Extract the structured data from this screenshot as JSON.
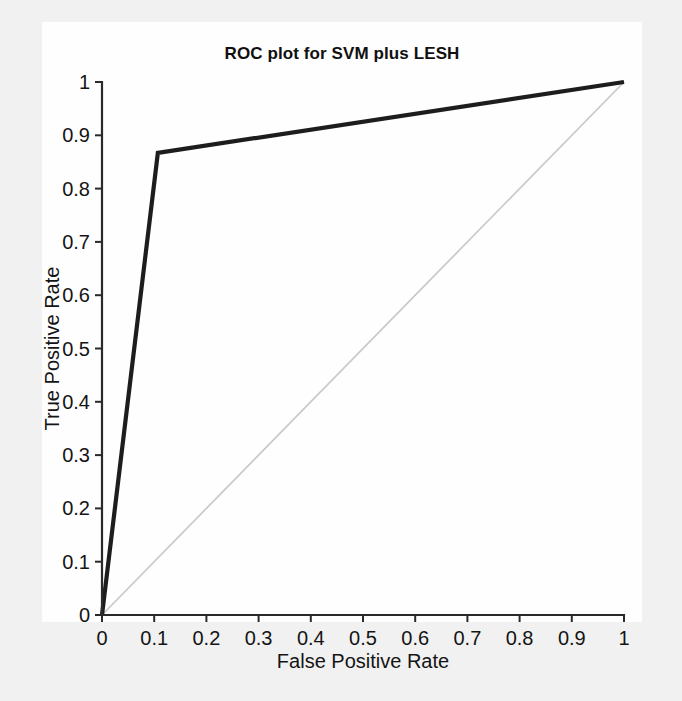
{
  "figure": {
    "background_color": "#f1f1f1",
    "canvas_color": "#fefefe"
  },
  "chart_data": {
    "type": "line",
    "title": "ROC plot for SVM plus LESH",
    "xlabel": "False Positive Rate",
    "ylabel": "True Positive Rate",
    "xlim": [
      0,
      1
    ],
    "ylim": [
      0,
      1
    ],
    "grid": false,
    "legend": null,
    "xticks": [
      0,
      0.1,
      0.2,
      0.3,
      0.4,
      0.5,
      0.6,
      0.7,
      0.8,
      0.9,
      1
    ],
    "yticks": [
      0,
      0.1,
      0.2,
      0.3,
      0.4,
      0.5,
      0.6,
      0.7,
      0.8,
      0.9,
      1
    ],
    "xtick_labels": [
      "0",
      "0.1",
      "0.2",
      "0.3",
      "0.4",
      "0.5",
      "0.6",
      "0.7",
      "0.8",
      "0.9",
      "1"
    ],
    "ytick_labels": [
      "0",
      "0.1",
      "0.2",
      "0.3",
      "0.4",
      "0.5",
      "0.6",
      "0.7",
      "0.8",
      "0.9",
      "1"
    ],
    "series": [
      {
        "name": "ROC curve (SVM plus LESH)",
        "color": "#1d1d1d",
        "linewidth": 4.2,
        "x": [
          0,
          0.107,
          1
        ],
        "y": [
          0,
          0.867,
          1
        ]
      },
      {
        "name": "chance diagonal",
        "color": "#c9c9c9",
        "linewidth": 1.7,
        "x": [
          0,
          1
        ],
        "y": [
          0,
          1
        ]
      }
    ]
  }
}
